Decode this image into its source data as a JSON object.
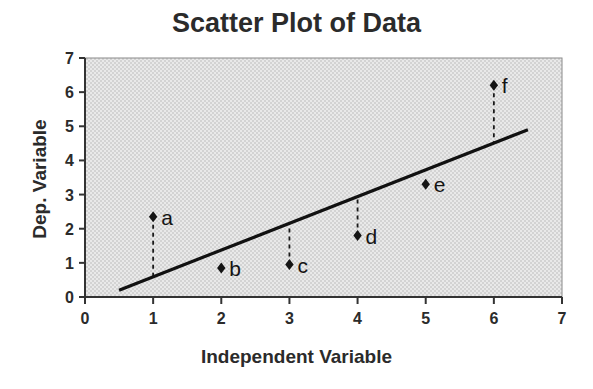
{
  "chart_data": {
    "type": "scatter",
    "title": "Scatter Plot of Data",
    "xlabel": "Independent Variable",
    "ylabel": "Dep. Variable",
    "xlim": [
      0,
      7
    ],
    "ylim": [
      0,
      7
    ],
    "xticks": [
      "0",
      "1",
      "2",
      "3",
      "4",
      "5",
      "6",
      "7"
    ],
    "yticks": [
      "0",
      "1",
      "2",
      "3",
      "4",
      "5",
      "6",
      "7"
    ],
    "grid": false,
    "legend": "none",
    "plot_background_color": "#e2e2e2",
    "marker_color": "#141414",
    "line_color": "#111111",
    "points": [
      {
        "label": "a",
        "x": 1,
        "y": 2.35
      },
      {
        "label": "b",
        "x": 2,
        "y": 0.85
      },
      {
        "label": "c",
        "x": 3,
        "y": 0.95
      },
      {
        "label": "d",
        "x": 4,
        "y": 1.8
      },
      {
        "label": "e",
        "x": 5,
        "y": 3.3
      },
      {
        "label": "f",
        "x": 6,
        "y": 6.2
      }
    ],
    "trend_line": {
      "name": "regression line",
      "x_start": 0.5,
      "y_start": 0.2,
      "x_end": 6.5,
      "y_end": 4.9,
      "slope": 0.783,
      "intercept": -0.192
    },
    "residual_lines": [
      {
        "label": "a",
        "x": 1,
        "y_point": 2.35,
        "y_line": 0.59
      },
      {
        "label": "b",
        "x": 2,
        "y_point": 0.85,
        "y_line": 1.37
      },
      {
        "label": "c",
        "x": 3,
        "y_point": 0.95,
        "y_line": 2.16
      },
      {
        "label": "d",
        "x": 4,
        "y_point": 1.8,
        "y_line": 2.94
      },
      {
        "label": "e",
        "x": 5,
        "y_point": 3.3,
        "y_line": 3.72
      },
      {
        "label": "f",
        "x": 6,
        "y_point": 6.2,
        "y_line": 4.51
      }
    ]
  }
}
